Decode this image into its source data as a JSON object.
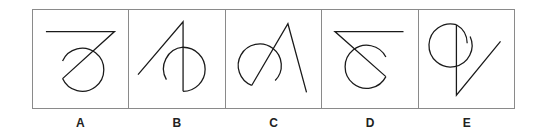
{
  "figure": {
    "options": [
      {
        "label": "A",
        "description": "horizontal line with diagonal to bottom-left, circle arc open on upper-left"
      },
      {
        "label": "B",
        "description": "diagonal line rising to top, vertical drop, circle arc open on lower-left"
      },
      {
        "label": "C",
        "description": "circle arc open on lower-right, lines forming inverted V with right leg long"
      },
      {
        "label": "D",
        "description": "horizontal line with diagonal to bottom-right, circle arc open on upper-right"
      },
      {
        "label": "E",
        "description": "circle arc open on right, vertical line then diagonal rising to right"
      }
    ],
    "stroke_color": "#1a1a1a",
    "border_color": "#8a8a8a"
  }
}
